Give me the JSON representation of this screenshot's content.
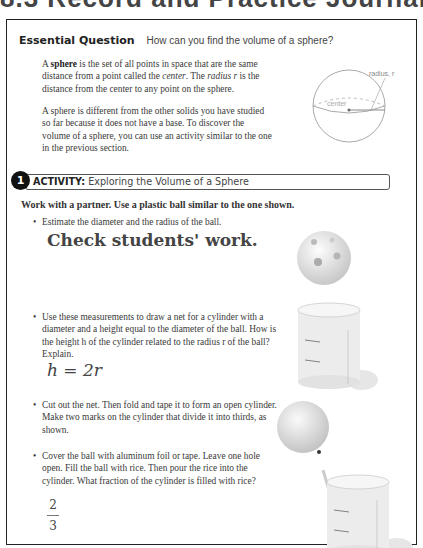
{
  "page": {
    "clipped_header": "8.3 Record and Practice Journal"
  },
  "essential_question": {
    "label": "Essential Question",
    "text": "How can you find the volume of a sphere?"
  },
  "intro": {
    "p1_bold": "sphere",
    "p1_a": "A ",
    "p1_b": " is the set of all points in space that are the same distance from a point called the ",
    "p1_center": "center",
    "p1_c": ". The ",
    "p1_radius": "radius r",
    "p1_d": " is the distance from the center to any point on the sphere.",
    "p2": "A sphere is different from the other solids you have studied so far because it does not have a base. To discover the volume of a sphere, you can use an activity similar to the one in the previous section."
  },
  "sphere_figure": {
    "label_radius": "radius, r",
    "label_center": "center"
  },
  "activity": {
    "number": "1",
    "label": "ACTIVITY:",
    "title": "Exploring the Volume of a Sphere",
    "instruction": "Work with a partner. Use a plastic ball similar to the one shown.",
    "bullets": [
      "Estimate the diameter and the radius of the ball.",
      "Use these measurements to draw a net for a cylinder with a diameter and a height equal to the diameter of the ball. How is the height h of the cylinder related to the radius r of the ball? Explain.",
      "Cut out the net. Then fold and tape it to form an open cylinder. Make two marks on the cylinder that divide it into thirds, as shown.",
      "Cover the ball with aluminum foil or tape. Leave one hole open. Fill the ball with rice. Then pour the rice into the cylinder. What fraction of the cylinder is filled with rice?"
    ],
    "answers": {
      "a1": "Check students' work.",
      "a2": "h = 2r",
      "a4_numerator": "2",
      "a4_denominator": "3"
    }
  }
}
